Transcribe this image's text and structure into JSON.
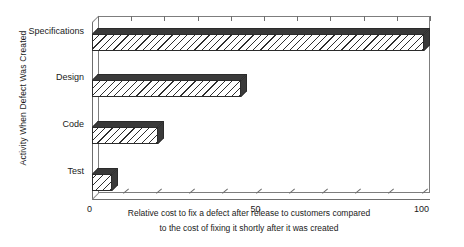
{
  "chart_data": {
    "type": "bar",
    "orientation": "horizontal",
    "title": "",
    "categories": [
      "Specifications",
      "Design",
      "Code",
      "Test"
    ],
    "values": [
      100,
      45,
      20,
      6
    ],
    "series": [
      {
        "name": "Relative cost to fix a defect",
        "values": [
          100,
          45,
          20,
          6
        ]
      }
    ],
    "xlabel_line1": "Relative cost to fix a defect after release to customers compared",
    "xlabel_line2": "to the cost of fixing it shortly after it was created",
    "ylabel": "Activity When Defect Was Created",
    "xlim": [
      0,
      100
    ],
    "xticks": [
      0,
      10,
      20,
      30,
      40,
      50,
      60,
      70,
      80,
      90,
      100
    ],
    "xtick_labels": [
      "0",
      "50",
      "100"
    ],
    "xtick_label_values": [
      0,
      50,
      100
    ],
    "grid": false,
    "legend": "none",
    "style": "3d-hatched-bars",
    "colors": {
      "bar_fill": "#ffffff",
      "bar_hatch": "#2f2f2f",
      "bar_shade": "#3a3a3a",
      "bar_outline": "#2b2b2b",
      "axis": "#6e6e6e",
      "frame": "#7d7d7d",
      "text": "#1a1a1a",
      "background": "#ffffff"
    }
  }
}
